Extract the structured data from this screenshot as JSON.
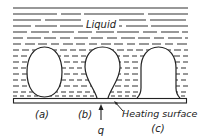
{
  "diagram": {
    "liquid_label": "Liquid",
    "bubbles": [
      {
        "id": "a",
        "label": "(a)",
        "shape": "oval"
      },
      {
        "id": "b",
        "label": "(b)",
        "shape": "teardrop"
      },
      {
        "id": "c",
        "label": "(c)",
        "shape": "dome"
      }
    ],
    "heat_flux_label": "q",
    "heating_surface_label": "Heating surface",
    "colors": {
      "line": "#222222",
      "background": "#ffffff"
    }
  }
}
